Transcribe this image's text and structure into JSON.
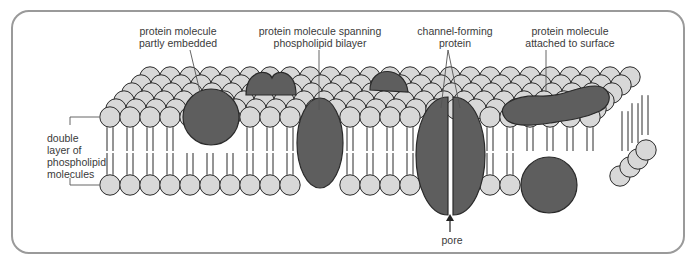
{
  "diagram": {
    "type": "cell membrane fluid mosaic model",
    "labels": {
      "partly_embedded": "protein molecule\npartly embedded",
      "spanning": "protein molecule spanning\nphospholipid bilayer",
      "channel": "channel-forming\nprotein",
      "surface": "protein molecule\nattached to surface",
      "bilayer": "double\nlayer of\nphospholipid\nmolecules",
      "pore": "pore"
    },
    "colors": {
      "head_fill": "#d8d8d8",
      "protein_fill": "#5e5e5e",
      "outline": "#2a2a2a",
      "frame": "#9a9a9a",
      "label_line": "#555555"
    }
  }
}
